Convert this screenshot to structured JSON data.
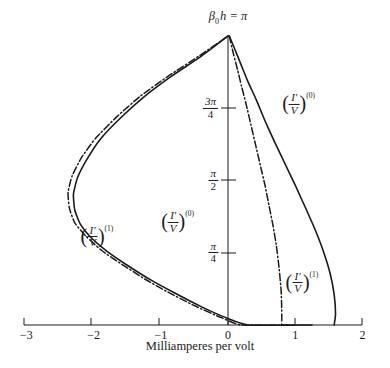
{
  "figure": {
    "background": "#ffffff",
    "ink": "#1a1a1a",
    "title": "β0h = π",
    "title_beta": "β",
    "title_sub": "0",
    "title_rest": "h = π"
  },
  "chart_data": {
    "type": "line",
    "title": "β0h = π",
    "xlabel": "Milliamperes per volt",
    "ylabel": "β0h",
    "xlim": [
      -3,
      2
    ],
    "ylim": [
      0,
      3.14159
    ],
    "grid": false,
    "legend": "inline-annotations",
    "xticks": [
      -3,
      -2,
      -1,
      0,
      1,
      2
    ],
    "xticklabels": [
      "−3",
      "−2",
      "−1",
      "0",
      "1",
      "2"
    ],
    "yticks": [
      0.7853981,
      1.5707963,
      2.3561944
    ],
    "yticklabels": [
      "π/4",
      "π/2",
      "3π/4"
    ],
    "ytick_fracs": [
      {
        "num": "π",
        "den": "4"
      },
      {
        "num": "π",
        "den": "2"
      },
      {
        "num": "3π",
        "den": "4"
      }
    ],
    "series": [
      {
        "name": "(I'/V)^(0)",
        "style": "solid",
        "description": "zeroth-order admittance, closed loop from apex down the right branch to +1.6 at y=0, and left branch through -2.3 back to +1.25 at y=0",
        "points_right": [
          [
            0.02,
            3.14159
          ],
          [
            0.1,
            3.0
          ],
          [
            0.2,
            2.82
          ],
          [
            0.3,
            2.64
          ],
          [
            0.42,
            2.45
          ],
          [
            0.55,
            2.22
          ],
          [
            0.7,
            1.98
          ],
          [
            0.85,
            1.75
          ],
          [
            1.0,
            1.52
          ],
          [
            1.15,
            1.28
          ],
          [
            1.3,
            1.03
          ],
          [
            1.42,
            0.8
          ],
          [
            1.52,
            0.56
          ],
          [
            1.58,
            0.33
          ],
          [
            1.6,
            0.12
          ],
          [
            1.58,
            0.0
          ]
        ],
        "points_left": [
          [
            0.0,
            3.14159
          ],
          [
            -0.4,
            2.92
          ],
          [
            -0.85,
            2.7
          ],
          [
            -1.25,
            2.48
          ],
          [
            -1.6,
            2.25
          ],
          [
            -1.9,
            2.02
          ],
          [
            -2.1,
            1.8
          ],
          [
            -2.24,
            1.6
          ],
          [
            -2.3,
            1.42
          ],
          [
            -2.28,
            1.25
          ],
          [
            -2.2,
            1.1
          ],
          [
            -2.05,
            0.96
          ],
          [
            -1.8,
            0.8
          ],
          [
            -1.5,
            0.65
          ],
          [
            -1.15,
            0.49
          ],
          [
            -0.8,
            0.35
          ],
          [
            -0.4,
            0.2
          ],
          [
            0.0,
            0.07
          ],
          [
            0.3,
            0.0
          ],
          [
            1.25,
            0.0
          ]
        ]
      },
      {
        "name": "(I'/V)^(1)",
        "style": "dash-dot",
        "description": "first-order admittance, from apex down steeply to +0.8 at y=0, and left branch through -2.35 back to +1.0 at y=0",
        "points_right": [
          [
            0.02,
            3.14159
          ],
          [
            0.08,
            2.95
          ],
          [
            0.14,
            2.78
          ],
          [
            0.2,
            2.6
          ],
          [
            0.27,
            2.4
          ],
          [
            0.34,
            2.18
          ],
          [
            0.41,
            1.96
          ],
          [
            0.48,
            1.74
          ],
          [
            0.55,
            1.52
          ],
          [
            0.61,
            1.3
          ],
          [
            0.67,
            1.08
          ],
          [
            0.72,
            0.86
          ],
          [
            0.76,
            0.62
          ],
          [
            0.79,
            0.38
          ],
          [
            0.8,
            0.16
          ],
          [
            0.8,
            0.0
          ]
        ],
        "points_left": [
          [
            0.0,
            3.14159
          ],
          [
            -0.42,
            2.93
          ],
          [
            -0.88,
            2.71
          ],
          [
            -1.3,
            2.49
          ],
          [
            -1.66,
            2.26
          ],
          [
            -1.97,
            2.03
          ],
          [
            -2.18,
            1.82
          ],
          [
            -2.32,
            1.62
          ],
          [
            -2.38,
            1.44
          ],
          [
            -2.36,
            1.27
          ],
          [
            -2.28,
            1.11
          ],
          [
            -2.12,
            0.97
          ],
          [
            -1.88,
            0.81
          ],
          [
            -1.58,
            0.66
          ],
          [
            -1.24,
            0.5
          ],
          [
            -0.9,
            0.36
          ],
          [
            -0.5,
            0.21
          ],
          [
            -0.1,
            0.08
          ],
          [
            0.2,
            0.0
          ],
          [
            1.0,
            0.0
          ]
        ]
      }
    ],
    "annotations": [
      {
        "id": "label-top-right",
        "text": "(I'/V)^(0)",
        "order": "(0)",
        "x": 1.05,
        "y": 2.4
      },
      {
        "id": "label-mid-left",
        "text": "(I'/V)^(0)",
        "order": "(0)",
        "x": -0.75,
        "y": 1.12
      },
      {
        "id": "label-far-left",
        "text": "(I'/V)^(1)",
        "order": "(1)",
        "x": -1.95,
        "y": 0.96
      },
      {
        "id": "label-bottom-right",
        "text": "(I'/V)^(1)",
        "order": "(1)",
        "x": 1.1,
        "y": 0.46
      }
    ]
  },
  "labels": {
    "numerator": "I′",
    "denominator": "V",
    "order_zero": "(0)",
    "order_one": "(1)",
    "x_caption": "Milliamperes per volt"
  }
}
